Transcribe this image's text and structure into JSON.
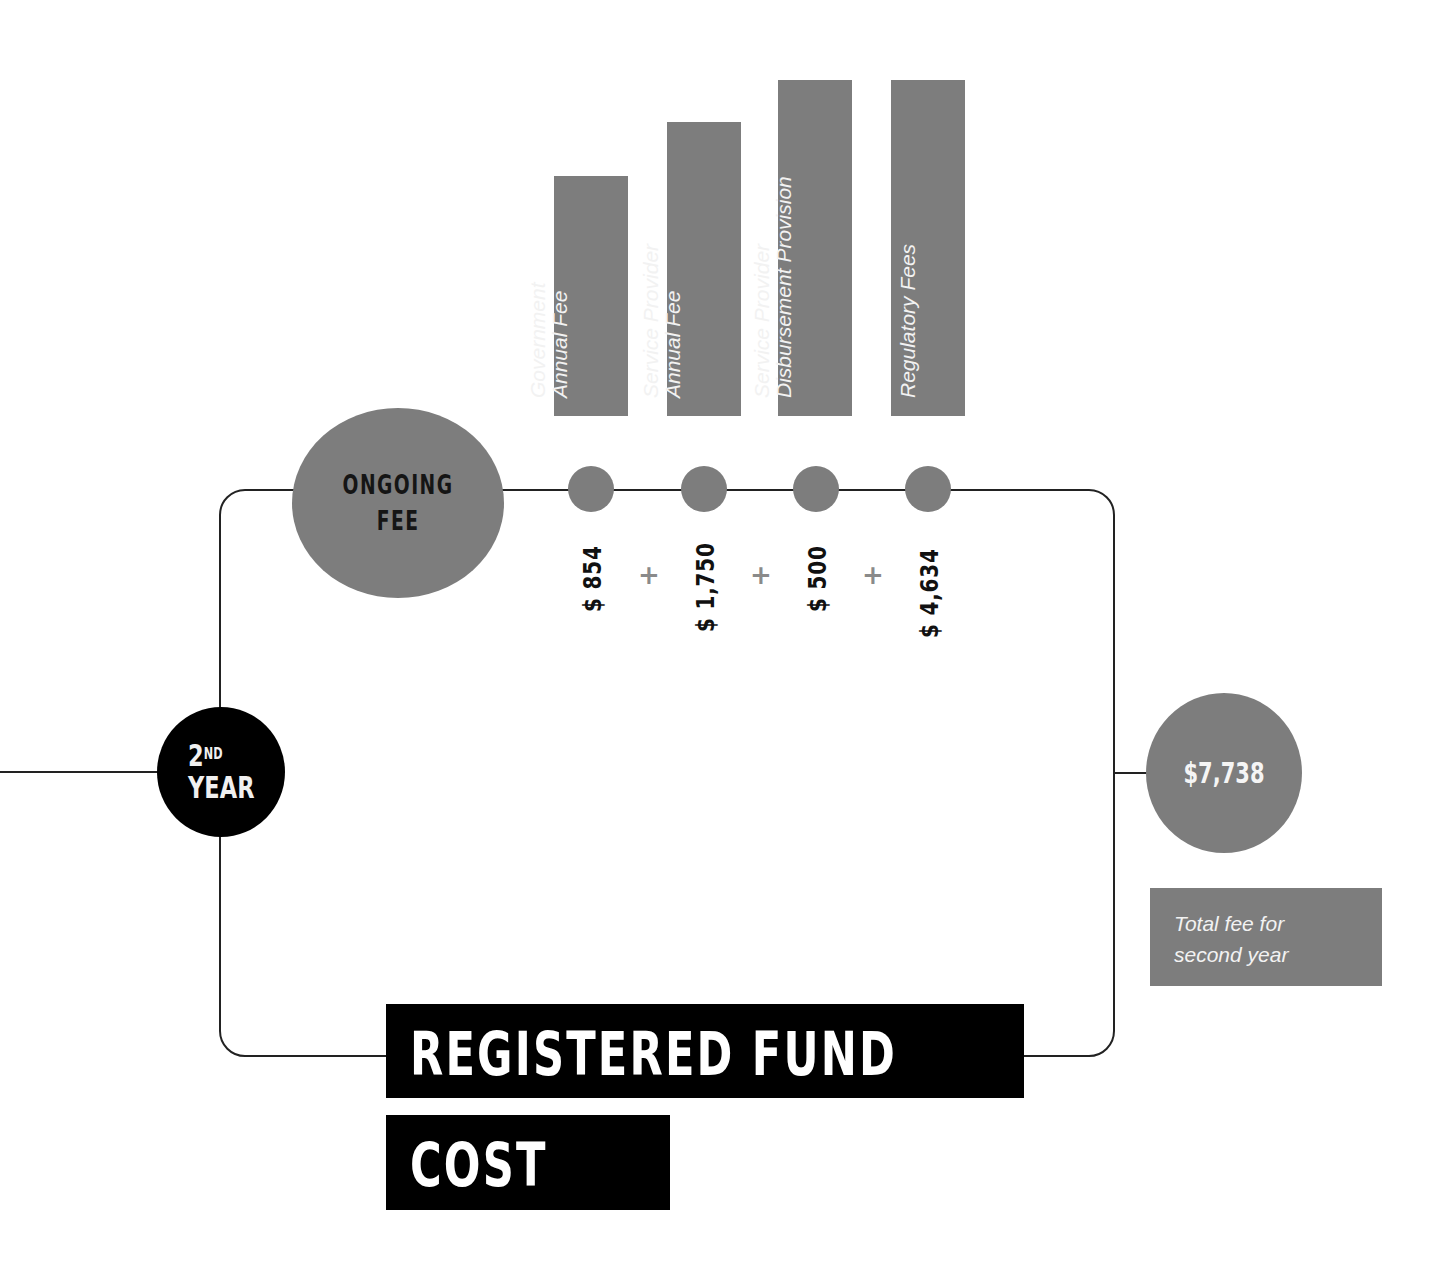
{
  "diagram": {
    "title_line1": "REGISTERED FUND",
    "title_line2": "COST",
    "year_node": {
      "number": "2",
      "suffix": "ND",
      "label": "YEAR"
    },
    "ongoing_node": {
      "line1": "ONGOING",
      "line2": "FEE"
    },
    "fee_items": [
      {
        "label_line1": "Government",
        "label_line2": "Annual Fee",
        "amount": "$ 854"
      },
      {
        "label_line1": "Service Provider",
        "label_line2": "Annual Fee",
        "amount": "$ 1,750"
      },
      {
        "label_line1": "Service Provider",
        "label_line2": "Disbursement Provision",
        "amount": "$ 500"
      },
      {
        "label_line1": "Regulatory Fees",
        "label_line2": "",
        "amount": "$ 4,634"
      }
    ],
    "operators": [
      "+",
      "+",
      "+"
    ],
    "total_node": {
      "amount": "$7,738"
    },
    "total_caption_line1": "Total fee for",
    "total_caption_line2": "second year",
    "colors": {
      "gray": "#7d7d7d",
      "black": "#000000",
      "line": "#222222"
    }
  }
}
